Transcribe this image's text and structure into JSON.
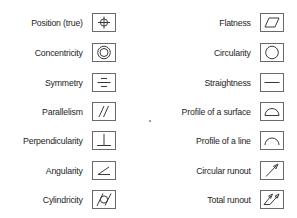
{
  "line_color": "#3a3a3a",
  "left_column": [
    {
      "label": "Position (true)",
      "icon": "position-icon"
    },
    {
      "label": "Concentricity",
      "icon": "concentricity-icon"
    },
    {
      "label": "Symmetry",
      "icon": "symmetry-icon"
    },
    {
      "label": "Parallelism",
      "icon": "parallelism-icon"
    },
    {
      "label": "Perpendicularity",
      "icon": "perpendicularity-icon"
    },
    {
      "label": "Angularity",
      "icon": "angularity-icon"
    },
    {
      "label": "Cylindricity",
      "icon": "cylindricity-icon"
    }
  ],
  "right_column": [
    {
      "label": "Flatness",
      "icon": "flatness-icon"
    },
    {
      "label": "Circularity",
      "icon": "circularity-icon"
    },
    {
      "label": "Straightness",
      "icon": "straightness-icon"
    },
    {
      "label": "Profile of a surface",
      "icon": "profile-surface-icon"
    },
    {
      "label": "Profile of a line",
      "icon": "profile-line-icon"
    },
    {
      "label": "Circular runout",
      "icon": "circular-runout-icon"
    },
    {
      "label": "Total runout",
      "icon": "total-runout-icon"
    }
  ]
}
